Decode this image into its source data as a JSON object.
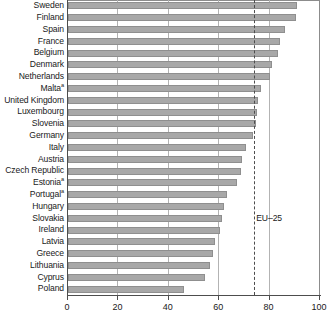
{
  "chart_data": {
    "type": "bar",
    "orientation": "horizontal",
    "title": "",
    "subtitle": "",
    "xlabel": "",
    "ylabel": "",
    "xlim": [
      0,
      100
    ],
    "xticks": [
      0,
      20,
      40,
      60,
      80,
      100
    ],
    "xtick_labels": [
      "0",
      "20",
      "40",
      "60",
      "80",
      "100"
    ],
    "grid": true,
    "grid_axis": "x",
    "legend": false,
    "bar_color": "#a8a8a8",
    "bar_edge_color": "#8f8f8f",
    "categories": [
      "Sweden",
      "Finland",
      "Spain",
      "France",
      "Belgium",
      "Denmark",
      "Netherlands",
      "Malta",
      "United Kingdom",
      "Luxembourg",
      "Slovenia",
      "Germany",
      "Italy",
      "Austria",
      "Czech Republic",
      "Estonia",
      "Portugal",
      "Hungary",
      "Slovakia",
      "Ireland",
      "Latvia",
      "Greece",
      "Lithuania",
      "Cyprus",
      "Poland"
    ],
    "category_footnotes": {
      "Malta": "a",
      "Estonia": "a",
      "Portugal": "a"
    },
    "values": [
      91.0,
      90.5,
      86.0,
      84.0,
      83.5,
      81.0,
      80.0,
      76.5,
      75.5,
      75.0,
      74.5,
      73.5,
      70.5,
      69.0,
      68.5,
      67.0,
      63.0,
      62.0,
      61.0,
      60.5,
      58.5,
      57.5,
      56.5,
      54.5,
      46.0
    ],
    "annotations": [
      {
        "name": "eu-25-reference-line",
        "label": "EU–25",
        "value": 74.3,
        "style": "dashed-vertical"
      }
    ]
  }
}
